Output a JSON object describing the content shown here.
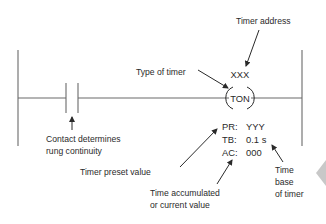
{
  "diagram": {
    "instruction": {
      "address": "XXX",
      "type": "TON",
      "preset_label": "PR:",
      "preset_value": "YYY",
      "timebase_label": "TB:",
      "timebase_value": "0.1 s",
      "accumulated_label": "AC:",
      "accumulated_value": "000"
    },
    "callouts": {
      "timer_address": "Timer address",
      "type_of_timer": "Type of timer",
      "contact_line1": "Contact determines",
      "contact_line2": "rung continuity",
      "preset": "Timer preset value",
      "accumulated_line1": "Time accumulated",
      "accumulated_line2": "or current value",
      "timebase_line1": "Time",
      "timebase_line2": "base",
      "timebase_line3": "of timer"
    },
    "colors": {
      "line": "#6a6a6a",
      "text": "#2a2a2a",
      "page_arrow": "#c8c8c8"
    }
  }
}
